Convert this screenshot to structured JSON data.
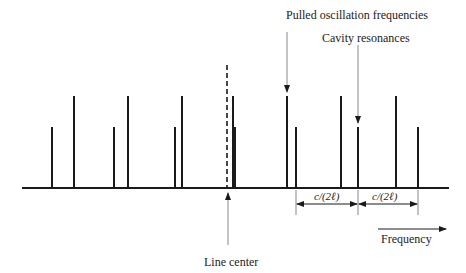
{
  "labels": {
    "pulled": "Pulled oscillation frequencies",
    "cavity": "Cavity resonances",
    "line_center": "Line center",
    "frequency": "Frequency",
    "spacing_1": "c/(2ℓ)",
    "spacing_2": "c/(2ℓ)"
  },
  "geometry": {
    "baseline_y": 188,
    "baseline_x": [
      22,
      449
    ],
    "tall_top_y": 96,
    "short_top_y": 127,
    "dashed_line": {
      "x": 227,
      "y_top": 65
    },
    "tall_lines_x": [
      74,
      128,
      182,
      233,
      287,
      341,
      396
    ],
    "short_lines_x": [
      52,
      114,
      175,
      235,
      296,
      358,
      418
    ]
  },
  "colors": {
    "line": "#1a1a1a",
    "arrow": "#888888",
    "text": "#222222"
  }
}
